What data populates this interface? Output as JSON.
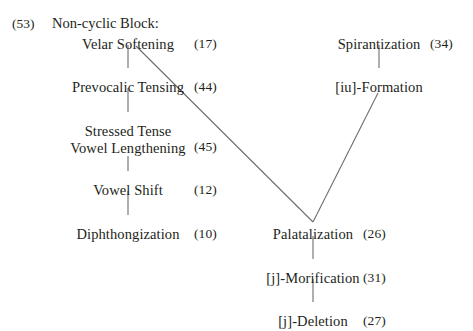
{
  "figure": {
    "caption_number": "(53)",
    "caption_title": "Non-cyclic Block:",
    "line_color": "#6d6d6d",
    "text_color": "#231f20",
    "background": "#ffffff"
  },
  "nodes": [
    {
      "id": "velar-softening",
      "label": "Velar Softening",
      "number": "(17)",
      "x": 128,
      "y": 36,
      "lines": 1
    },
    {
      "id": "prevocalic-tensing",
      "label": "Prevocalic Tensing",
      "number": "(44)",
      "x": 128,
      "y": 79,
      "lines": 1
    },
    {
      "id": "stressed-tense-vowel-lengthening",
      "label_line1": "Stressed Tense",
      "label_line2": "Vowel Lengthening",
      "number": "(45)",
      "x": 128,
      "y": 123,
      "lines": 2
    },
    {
      "id": "vowel-shift",
      "label": "Vowel Shift",
      "number": "(12)",
      "x": 128,
      "y": 182,
      "lines": 1
    },
    {
      "id": "diphthongization",
      "label": "Diphthongization",
      "number": "(10)",
      "x": 128,
      "y": 226,
      "lines": 1
    },
    {
      "id": "spirantization",
      "label": "Spirantization",
      "number": "(34)",
      "x": 379,
      "y": 36,
      "lines": 1
    },
    {
      "id": "iu-formation",
      "label": "[iu]-Formation",
      "number": "",
      "x": 379,
      "y": 79,
      "lines": 1
    },
    {
      "id": "palatalization",
      "label": "Palatalization",
      "number": "(26)",
      "x": 313,
      "y": 226,
      "lines": 1
    },
    {
      "id": "j-morification",
      "label": "[j]-Morification",
      "number": "(31)",
      "x": 313,
      "y": 270,
      "lines": 1
    },
    {
      "id": "j-deletion",
      "label": "[j]-Deletion",
      "number": "(27)",
      "x": 313,
      "y": 313,
      "lines": 1
    }
  ],
  "numbers_layout": {
    "left_column_x": 194,
    "right_column_x": 363,
    "right_upper_column_x": 430
  },
  "edges": [
    {
      "id": "velar-softening-to-prevocalic-tensing",
      "from": "velar-softening",
      "to": "prevocalic-tensing",
      "x1": 128,
      "y1": 45,
      "x2": 128,
      "y2": 68
    },
    {
      "id": "prevocalic-tensing-to-stressed-tense",
      "from": "prevocalic-tensing",
      "to": "stressed-tense-vowel-lengthening",
      "x1": 128,
      "y1": 88,
      "x2": 128,
      "y2": 112
    },
    {
      "id": "stressed-tense-to-vowel-shift",
      "from": "stressed-tense-vowel-lengthening",
      "to": "vowel-shift",
      "x1": 128,
      "y1": 156,
      "x2": 128,
      "y2": 171
    },
    {
      "id": "vowel-shift-to-diphthongization",
      "from": "vowel-shift",
      "to": "diphthongization",
      "x1": 128,
      "y1": 191,
      "x2": 128,
      "y2": 215
    },
    {
      "id": "velar-softening-to-palatalization",
      "from": "velar-softening",
      "to": "palatalization",
      "x1": 136,
      "y1": 46,
      "x2": 313,
      "y2": 222
    },
    {
      "id": "spirantization-to-iu-formation",
      "from": "spirantization",
      "to": "iu-formation",
      "x1": 379,
      "y1": 45,
      "x2": 379,
      "y2": 68
    },
    {
      "id": "iu-formation-to-palatalization",
      "from": "iu-formation",
      "to": "palatalization",
      "x1": 378,
      "y1": 93,
      "x2": 313,
      "y2": 222
    },
    {
      "id": "palatalization-to-j-morification",
      "from": "palatalization",
      "to": "j-morification",
      "x1": 313,
      "y1": 236,
      "x2": 313,
      "y2": 259
    },
    {
      "id": "j-morification-to-j-deletion",
      "from": "j-morification",
      "to": "j-deletion",
      "x1": 313,
      "y1": 279,
      "x2": 313,
      "y2": 302
    }
  ]
}
